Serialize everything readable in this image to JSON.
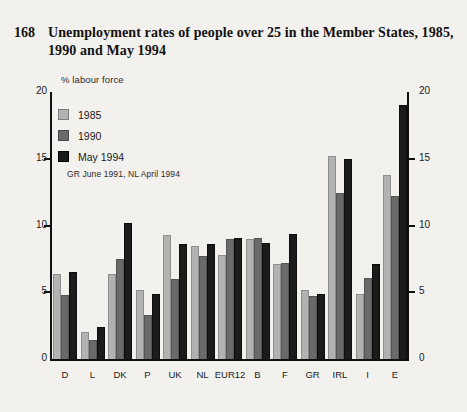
{
  "figure": {
    "number": "168",
    "title": "Unemployment rates of people over 25 in the Member States, 1985, 1990 and May 1994"
  },
  "axis_units_label": "% labour force",
  "legend": {
    "items": [
      {
        "label": "1985",
        "color": "#b2b2b2"
      },
      {
        "label": "1990",
        "color": "#6a6a6a"
      },
      {
        "label": "May 1994",
        "color": "#1b1b1b"
      }
    ],
    "note": "GR June 1991, NL April 1994"
  },
  "ticks": {
    "left": [
      "20",
      "15",
      "10",
      "5",
      "0"
    ],
    "right": [
      "20",
      "15",
      "10",
      "5",
      "0"
    ]
  },
  "chart_data": {
    "type": "bar",
    "title": "Unemployment rates of people over 25 in the Member States, 1985, 1990 and May 1994",
    "xlabel": "",
    "ylabel": "% labour force",
    "ylim": [
      0,
      20
    ],
    "yticks": [
      0,
      5,
      10,
      15,
      20
    ],
    "grid": false,
    "legend_position": "top-left",
    "annotations": [
      "GR June 1991, NL April 1994"
    ],
    "categories": [
      "D",
      "L",
      "DK",
      "P",
      "UK",
      "NL",
      "EUR12",
      "B",
      "F",
      "GR",
      "IRL",
      "I",
      "E"
    ],
    "series": [
      {
        "name": "1985",
        "color": "#b2b2b2",
        "values": [
          6.4,
          2.0,
          6.4,
          5.2,
          9.3,
          8.5,
          7.8,
          9.0,
          7.1,
          5.2,
          15.2,
          4.9,
          13.8
        ]
      },
      {
        "name": "1990",
        "color": "#6a6a6a",
        "values": [
          4.8,
          1.4,
          7.5,
          3.3,
          6.0,
          7.7,
          9.0,
          9.1,
          7.2,
          4.7,
          12.4,
          6.1,
          12.2
        ]
      },
      {
        "name": "May 1994",
        "color": "#1b1b1b",
        "values": [
          6.5,
          2.4,
          10.2,
          4.9,
          8.6,
          8.6,
          9.1,
          8.7,
          9.4,
          4.9,
          15.0,
          7.1,
          19.0
        ]
      }
    ]
  }
}
